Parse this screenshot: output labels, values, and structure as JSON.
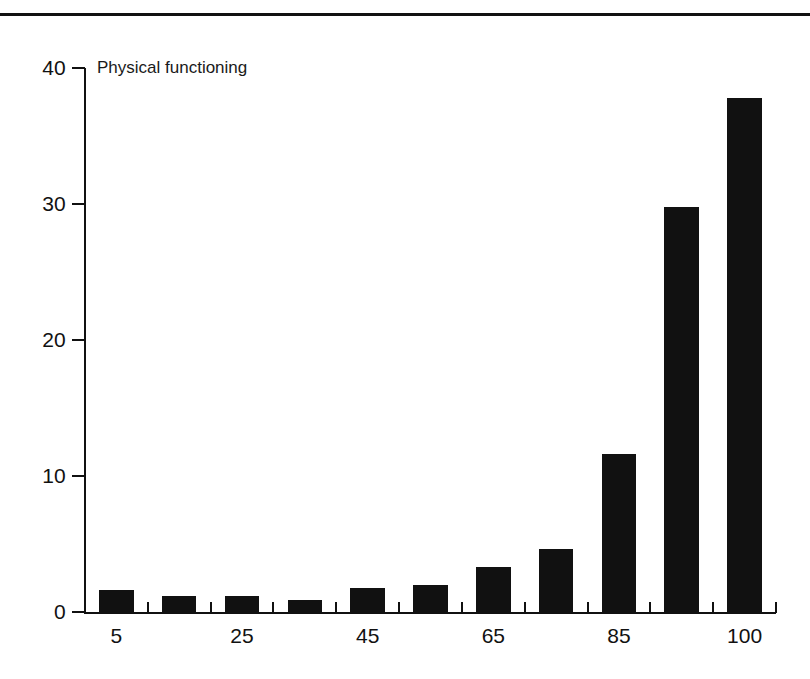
{
  "chart_data": {
    "type": "bar",
    "title": "Physical functioning",
    "xlabel": "",
    "ylabel": "",
    "categories": [
      "5",
      "15",
      "25",
      "35",
      "45",
      "55",
      "65",
      "75",
      "85",
      "95",
      "100"
    ],
    "values": [
      1.6,
      1.2,
      1.2,
      0.9,
      1.8,
      2.0,
      3.3,
      4.6,
      11.6,
      29.8,
      37.8
    ],
    "ylim": [
      0,
      40
    ],
    "yticks": [
      0,
      10,
      20,
      30,
      40
    ],
    "ytick_labels": [
      "0",
      "10",
      "20",
      "30",
      "40"
    ],
    "xtick_labels": [
      "5",
      "25",
      "45",
      "65",
      "85",
      "100"
    ],
    "xtick_label_indices": [
      0,
      2,
      4,
      6,
      8,
      10
    ],
    "grid": false,
    "legend": "none",
    "bar_color": "#111111",
    "axis_color": "#111111",
    "background": "#ffffff"
  }
}
